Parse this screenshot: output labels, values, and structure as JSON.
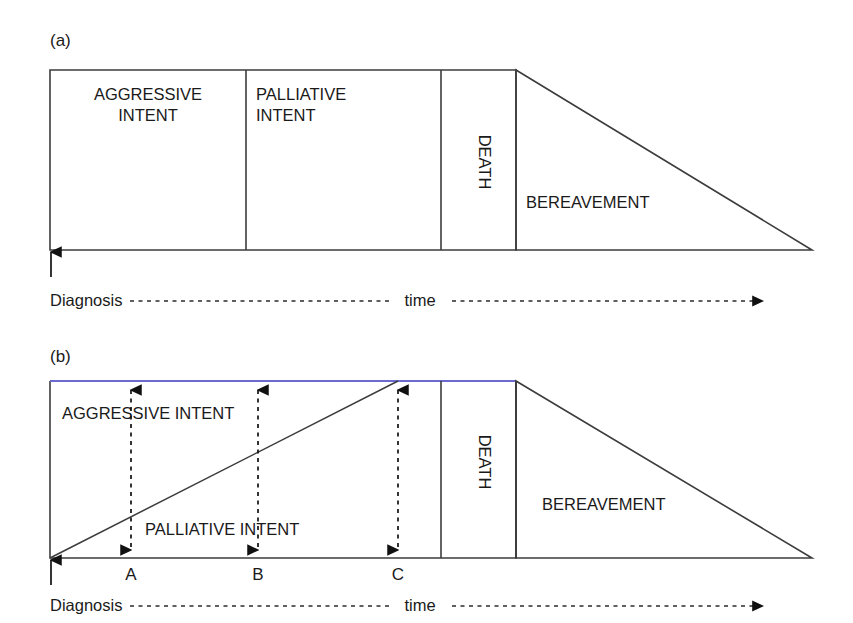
{
  "figure": {
    "panels": [
      {
        "id": "a",
        "label": "(a)",
        "segments": [
          {
            "name": "aggressive",
            "text": "AGGRESSIVE\nINTENT",
            "line1": "AGGRESSIVE",
            "line2": "INTENT",
            "align": "center"
          },
          {
            "name": "palliative",
            "text": "PALLIATIVE\nINTENT",
            "line1": "PALLIATIVE",
            "line2": "INTENT",
            "align": "left"
          },
          {
            "name": "death",
            "text": "DEATH",
            "orientation": "vertical"
          },
          {
            "name": "bereavement",
            "text": "BEREAVEMENT",
            "shape": "triangle"
          }
        ],
        "axis": {
          "start_label": "Diagnosis",
          "mid_label": "time",
          "arrow": "right-arrowhead",
          "start_tick": "up-arrowhead"
        }
      },
      {
        "id": "b",
        "label": "(b)",
        "segments": [
          {
            "name": "aggressive",
            "text": "AGGRESSIVE INTENT"
          },
          {
            "name": "palliative",
            "text": "PALLIATIVE INTENT"
          },
          {
            "name": "death",
            "text": "DEATH",
            "orientation": "vertical"
          },
          {
            "name": "bereavement",
            "text": "BEREAVEMENT",
            "shape": "triangle"
          }
        ],
        "markers": [
          {
            "id": "A",
            "label": "A"
          },
          {
            "id": "B",
            "label": "B"
          },
          {
            "id": "C",
            "label": "C"
          }
        ],
        "axis": {
          "start_label": "Diagnosis",
          "mid_label": "time",
          "arrow": "right-arrowhead",
          "start_tick": "up-arrowhead"
        }
      }
    ],
    "colors": {
      "line": "#3c3c3c",
      "accent_blue": "#6a6ad0",
      "text": "#1a1a1a",
      "background": "#ffffff"
    }
  }
}
